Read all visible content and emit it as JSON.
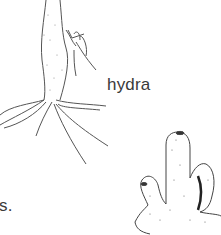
{
  "figure": {
    "labels": {
      "hydra": "hydra",
      "partial_left": "s."
    },
    "organisms": [
      {
        "name": "hydra",
        "description": "stalked body with budding polyp and trailing tentacles at base"
      },
      {
        "name": "sponge",
        "description": "tubular finger-like colony with oscula at tips"
      }
    ],
    "colors": {
      "ink": "#3a3a3a",
      "background": "#ffffff"
    }
  }
}
